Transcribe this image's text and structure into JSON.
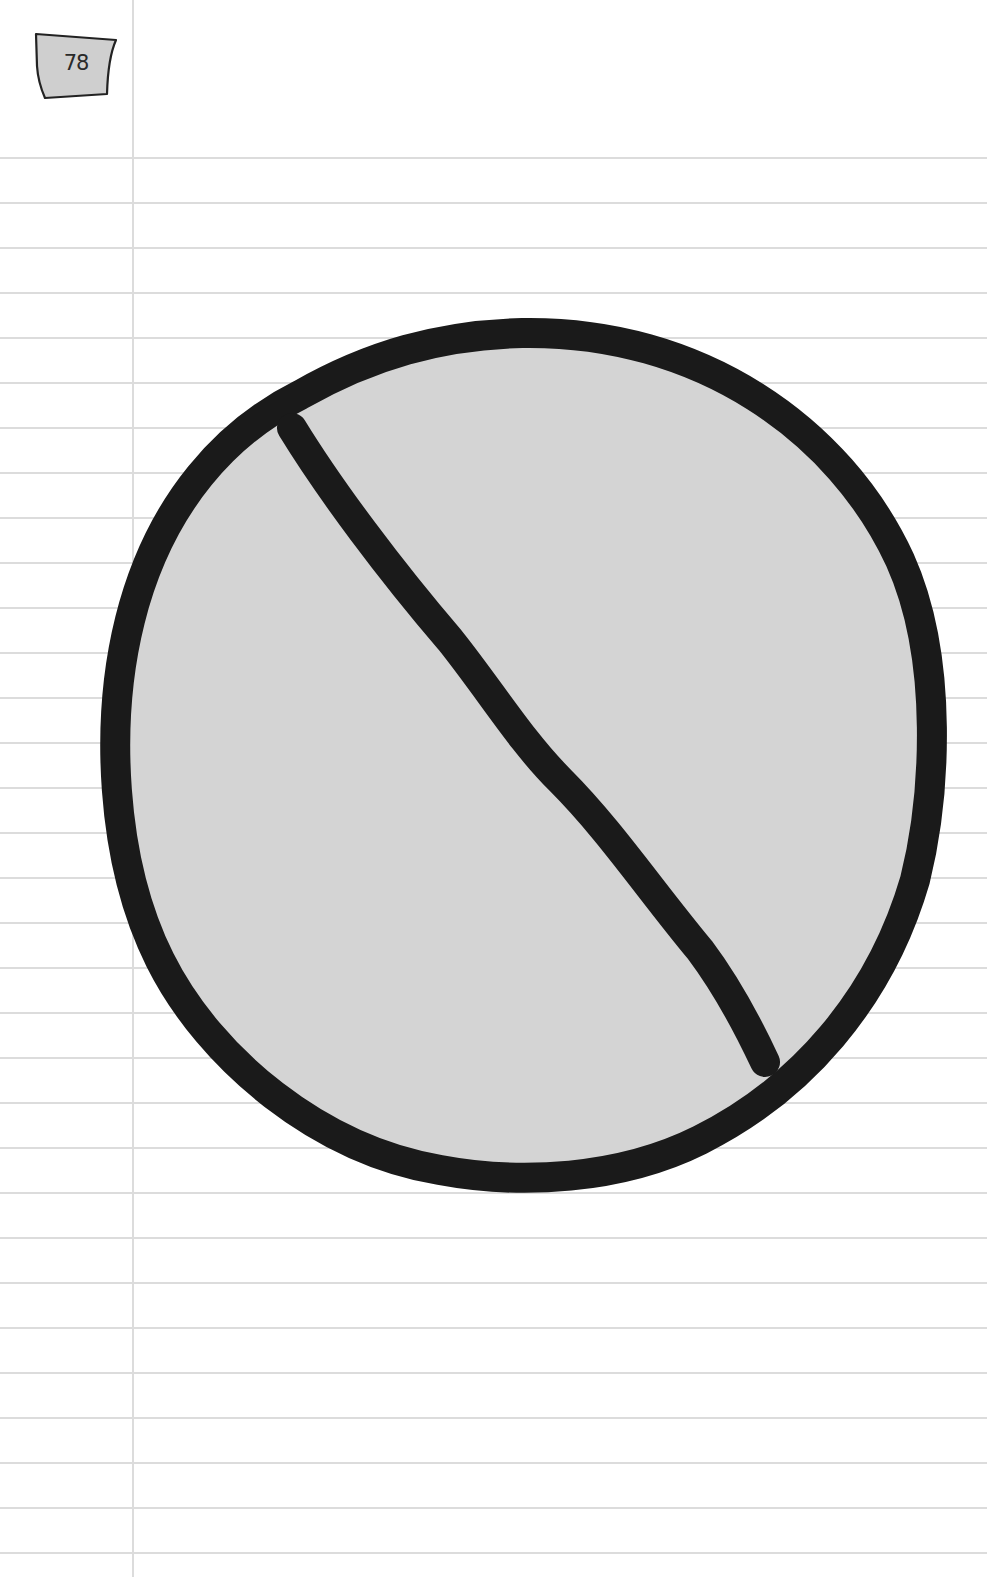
{
  "page": {
    "number": "78",
    "background_color": "#ffffff",
    "rule_color": "#dcdcdc",
    "rule_first_y": 157,
    "rule_spacing": 45,
    "margin_x": 132
  },
  "illustration": {
    "type": "prohibition-sign",
    "fill_color": "#d4d4d4",
    "stroke_color": "#1a1a1a",
    "center": [
      522,
      755
    ],
    "radius_x": 422,
    "radius_y": 438
  }
}
